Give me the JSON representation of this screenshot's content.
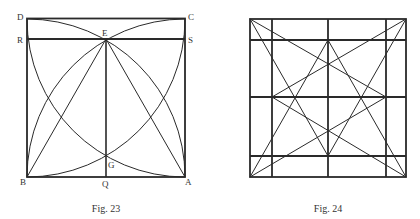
{
  "figures": [
    {
      "id": "fig23",
      "caption": "Fig. 23",
      "points": {
        "D": "D",
        "C": "C",
        "R": "R",
        "E": "E",
        "S": "S",
        "G": "G",
        "B": "B",
        "Q": "Q",
        "A": "A"
      }
    },
    {
      "id": "fig24",
      "caption": "Fig. 24"
    }
  ],
  "colors": {
    "line": "#2a2a2a",
    "text": "#333333",
    "background": "#ffffff"
  }
}
